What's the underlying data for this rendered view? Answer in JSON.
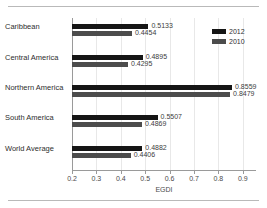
{
  "chart_data": {
    "type": "bar",
    "orientation": "horizontal",
    "title": "",
    "xlabel": "EGDI",
    "ylabel": "",
    "xlim": [
      0.2,
      0.95
    ],
    "xticks": [
      0.2,
      0.3,
      0.4,
      0.5,
      0.6,
      0.7,
      0.8,
      0.9
    ],
    "xtick_labels": [
      "0.2",
      "0.3",
      "0.4",
      "0.5",
      "0.6",
      "0.7",
      "0.8",
      "0.9"
    ],
    "grid": "vertical",
    "legend_position": "top-right",
    "categories": [
      "Caribbean",
      "Central America",
      "Northern America",
      "South America",
      "World Average"
    ],
    "series": [
      {
        "name": "2012",
        "color": "#151515",
        "values": [
          0.5133,
          0.4895,
          0.8559,
          0.5507,
          0.4882
        ],
        "labels": [
          "0.5133",
          "0.4895",
          "0.8559",
          "0.5507",
          "0.4882"
        ]
      },
      {
        "name": "2010",
        "color": "#4c4c4c",
        "values": [
          0.4454,
          0.4295,
          0.8479,
          0.4869,
          0.4406
        ],
        "labels": [
          "0.4454",
          "0.4295",
          "0.8479",
          "0.4869",
          "0.4406"
        ]
      }
    ]
  },
  "legend": {
    "entries": [
      {
        "label": "2012",
        "color": "#151515"
      },
      {
        "label": "2010",
        "color": "#4c4c4c"
      }
    ]
  }
}
